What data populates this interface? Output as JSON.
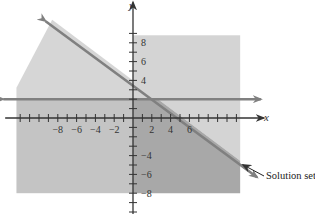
{
  "chart_data": {
    "type": "area",
    "title": "",
    "xlabel": "x",
    "ylabel": "y",
    "xlim": [
      -13,
      11
    ],
    "ylim": [
      -8,
      12
    ],
    "grid": false,
    "x_ticks": [
      -12,
      -11,
      -10,
      -9,
      -8,
      -7,
      -6,
      -5,
      -4,
      -3,
      -2,
      -1,
      1,
      2,
      3,
      4,
      5,
      6,
      7,
      8,
      9,
      10,
      11
    ],
    "y_ticks": [
      -10,
      -9,
      -8,
      -7,
      -6,
      -5,
      -4,
      -3,
      -2,
      -1,
      1,
      2,
      3,
      4,
      5,
      6,
      7,
      8,
      9
    ],
    "x_tick_labels": [
      {
        "value": -8,
        "text": "−8"
      },
      {
        "value": -6,
        "text": "−6"
      },
      {
        "value": -4,
        "text": "−4"
      },
      {
        "value": -2,
        "text": "−2"
      },
      {
        "value": 2,
        "text": "2"
      },
      {
        "value": 4,
        "text": "4"
      },
      {
        "value": 6,
        "text": "6"
      }
    ],
    "y_tick_labels": [
      {
        "value": 8,
        "text": "8"
      },
      {
        "value": 6,
        "text": "6"
      },
      {
        "value": 4,
        "text": "4"
      },
      {
        "value": -4,
        "text": "−4"
      },
      {
        "value": -6,
        "text": "−6"
      },
      {
        "value": -8,
        "text": "−8"
      }
    ],
    "shaded_frame": {
      "x": [
        -12.4,
        11.4
      ],
      "y": [
        -8,
        8.8
      ]
    },
    "lines": [
      {
        "name": "boundary-slanted",
        "equation": "3x + 4y = 16",
        "from": [
          -9.3,
          10.3
        ],
        "to": [
          13.2,
          -6.3
        ],
        "arrows": "both"
      },
      {
        "name": "boundary-horizontal",
        "equation": "y = 2",
        "from": [
          -13.8,
          2
        ],
        "to": [
          13.6,
          2
        ],
        "arrows": "both"
      }
    ],
    "regions": [
      {
        "name": "above-slanted-line",
        "inequality": "3x + 4y >= 16",
        "shade": "light"
      },
      {
        "name": "left-below-horizontal",
        "inequality": "x <= 0, y <= 2",
        "shade": "medium"
      },
      {
        "name": "solution-set",
        "inequality": "x >= 0, y <= 2, 3x + 4y <= 16",
        "shade": "dark"
      }
    ],
    "annotations": [
      {
        "text": "Solution set",
        "points_to": [
          11.5,
          -5.2
        ]
      }
    ],
    "colors": {
      "light": "#d4d4d4",
      "medium": "#c4c4c4",
      "upper_left": "#d6d6d6",
      "dark": "#a8a8a8",
      "line": "#808080",
      "axis": "#333333"
    }
  }
}
